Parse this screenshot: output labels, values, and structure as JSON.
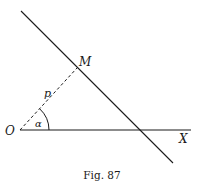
{
  "figure": {
    "caption": "Fig. 87",
    "labels": {
      "origin": "O",
      "point_m": "M",
      "axis": "X",
      "distance": "p",
      "angle": "α"
    },
    "colors": {
      "ink": "#1a1a1a",
      "background": "#ffffff"
    }
  }
}
